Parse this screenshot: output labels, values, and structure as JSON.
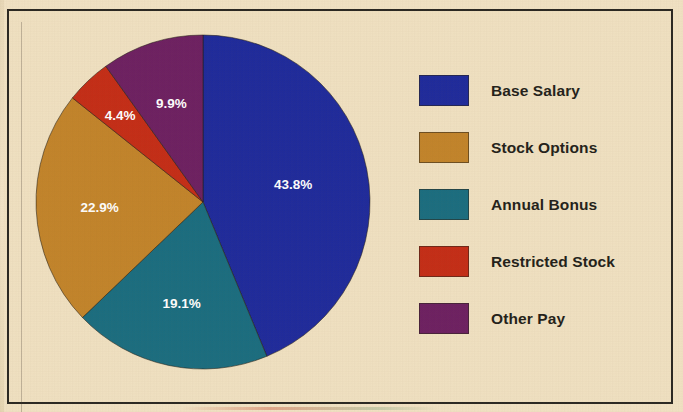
{
  "figure": {
    "background_color": "#f1e2c4",
    "frame_color": "#2a2722"
  },
  "chart_data": {
    "type": "pie",
    "title": "",
    "subtitle": "",
    "xlabel": "",
    "ylabel": "",
    "grid": false,
    "legend_position": "right",
    "start_angle_deg": 90,
    "direction": "clockwise",
    "categories": [
      "Base Salary",
      "Stock Options",
      "Annual Bonus",
      "Restricted Stock",
      "Other Pay"
    ],
    "values": [
      43.8,
      22.9,
      19.1,
      4.4,
      9.9
    ],
    "value_unit": "%",
    "colors": [
      "#1e2a9c",
      "#c2842b",
      "#1a6d80",
      "#c42d17",
      "#6d2062"
    ],
    "label_color": "#ffffff",
    "slices": [
      {
        "label": "Base Salary",
        "value": 43.8,
        "display": "43.8%",
        "color": "#1e2a9c",
        "draw_order": 1
      },
      {
        "label": "Annual Bonus",
        "value": 19.1,
        "display": "19.1%",
        "color": "#1a6d80",
        "draw_order": 2
      },
      {
        "label": "Stock Options",
        "value": 22.9,
        "display": "22.9%",
        "color": "#c2842b",
        "draw_order": 3
      },
      {
        "label": "Restricted Stock",
        "value": 4.4,
        "display": "4.4%",
        "color": "#c42d17",
        "draw_order": 4
      },
      {
        "label": "Other Pay",
        "value": 9.9,
        "display": "9.9%",
        "color": "#6d2062",
        "draw_order": 5
      }
    ]
  },
  "pie": {
    "labels": {
      "base_salary": "43.8%",
      "annual_bonus": "19.1%",
      "stock_options": "22.9%",
      "restricted_stock": "4.4%",
      "other_pay": "9.9%"
    }
  },
  "legend": {
    "items": [
      {
        "label": "Base Salary",
        "color": "#1e2a9c"
      },
      {
        "label": "Stock Options",
        "color": "#c2842b"
      },
      {
        "label": "Annual Bonus",
        "color": "#1a6d80"
      },
      {
        "label": "Restricted Stock",
        "color": "#c42d17"
      },
      {
        "label": "Other Pay",
        "color": "#6d2062"
      }
    ]
  }
}
